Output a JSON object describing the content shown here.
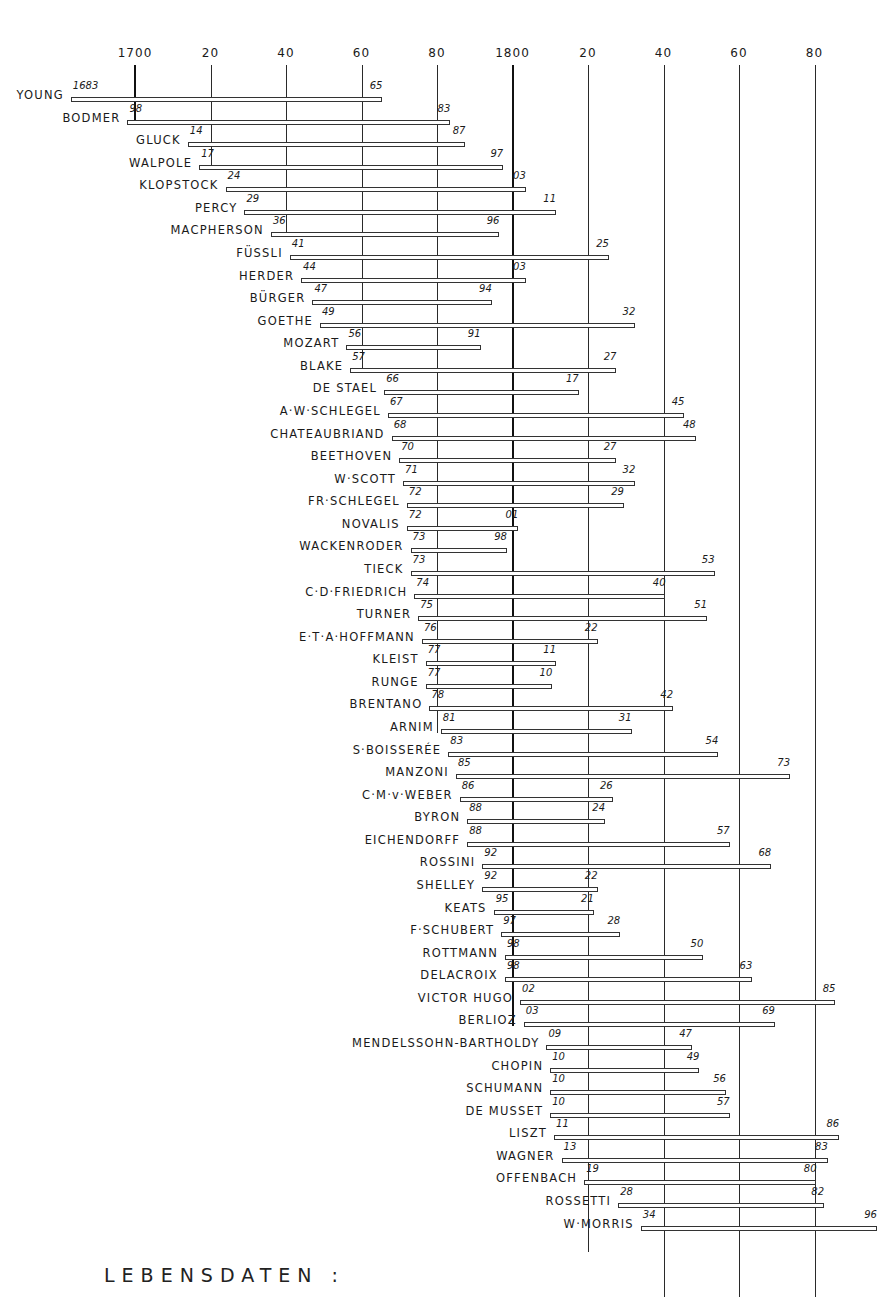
{
  "caption": "LEBENSDATEN :",
  "chart_data": {
    "type": "bar",
    "subtype": "timeline-gantt",
    "title": "LEBENSDATEN :",
    "xlabel": "",
    "ylabel": "",
    "xlim": [
      1680,
      1900
    ],
    "ticks": [
      {
        "year": 1700,
        "label": "1700"
      },
      {
        "year": 1720,
        "label": "20"
      },
      {
        "year": 1740,
        "label": "40"
      },
      {
        "year": 1760,
        "label": "60"
      },
      {
        "year": 1780,
        "label": "80"
      },
      {
        "year": 1800,
        "label": "1800"
      },
      {
        "year": 1820,
        "label": "20"
      },
      {
        "year": 1840,
        "label": "40"
      },
      {
        "year": 1860,
        "label": "60"
      },
      {
        "year": 1880,
        "label": "80"
      }
    ],
    "gridlines": [
      {
        "year": 1700,
        "end_row": 1,
        "major": true
      },
      {
        "year": 1720,
        "end_row": 3,
        "major": false
      },
      {
        "year": 1740,
        "end_row": 6,
        "major": false
      },
      {
        "year": 1760,
        "end_row": 12,
        "major": false
      },
      {
        "year": 1780,
        "end_row": 28,
        "major": false
      },
      {
        "year": 1800,
        "end_row": 41,
        "major": true
      },
      {
        "year": 1820,
        "end_row": 51,
        "major": false
      },
      {
        "year": 1840,
        "end_row": 53,
        "major": false
      },
      {
        "year": 1860,
        "end_row": 53,
        "major": false
      },
      {
        "year": 1880,
        "end_row": 53,
        "major": false
      }
    ],
    "series": [
      {
        "name": "YOUNG",
        "birth": 1683,
        "death": 1765,
        "birth_label": "1683",
        "death_label": "65"
      },
      {
        "name": "BODMER",
        "birth": 1698,
        "death": 1783,
        "birth_label": "98",
        "death_label": "83"
      },
      {
        "name": "GLUCK",
        "birth": 1714,
        "death": 1787,
        "birth_label": "14",
        "death_label": "87"
      },
      {
        "name": "WALPOLE",
        "birth": 1717,
        "death": 1797,
        "birth_label": "17",
        "death_label": "97"
      },
      {
        "name": "KLOPSTOCK",
        "birth": 1724,
        "death": 1803,
        "birth_label": "24",
        "death_label": "03"
      },
      {
        "name": "PERCY",
        "birth": 1729,
        "death": 1811,
        "birth_label": "29",
        "death_label": "11"
      },
      {
        "name": "MACPHERSON",
        "birth": 1736,
        "death": 1796,
        "birth_label": "36",
        "death_label": "96"
      },
      {
        "name": "FÜSSLI",
        "birth": 1741,
        "death": 1825,
        "birth_label": "41",
        "death_label": "25"
      },
      {
        "name": "HERDER",
        "birth": 1744,
        "death": 1803,
        "birth_label": "44",
        "death_label": "03"
      },
      {
        "name": "BÜRGER",
        "birth": 1747,
        "death": 1794,
        "birth_label": "47",
        "death_label": "94"
      },
      {
        "name": "GOETHE",
        "birth": 1749,
        "death": 1832,
        "birth_label": "49",
        "death_label": "32"
      },
      {
        "name": "MOZART",
        "birth": 1756,
        "death": 1791,
        "birth_label": "56",
        "death_label": "91"
      },
      {
        "name": "BLAKE",
        "birth": 1757,
        "death": 1827,
        "birth_label": "57",
        "death_label": "27"
      },
      {
        "name": "DE STAEL",
        "birth": 1766,
        "death": 1817,
        "birth_label": "66",
        "death_label": "17"
      },
      {
        "name": "A·W·SCHLEGEL",
        "birth": 1767,
        "death": 1845,
        "birth_label": "67",
        "death_label": "45"
      },
      {
        "name": "CHATEAUBRIAND",
        "birth": 1768,
        "death": 1848,
        "birth_label": "68",
        "death_label": "48"
      },
      {
        "name": "BEETHOVEN",
        "birth": 1770,
        "death": 1827,
        "birth_label": "70",
        "death_label": "27"
      },
      {
        "name": "W·SCOTT",
        "birth": 1771,
        "death": 1832,
        "birth_label": "71",
        "death_label": "32"
      },
      {
        "name": "FR·SCHLEGEL",
        "birth": 1772,
        "death": 1829,
        "birth_label": "72",
        "death_label": "29"
      },
      {
        "name": "NOVALIS",
        "birth": 1772,
        "death": 1801,
        "birth_label": "72",
        "death_label": "01"
      },
      {
        "name": "WACKENRODER",
        "birth": 1773,
        "death": 1798,
        "birth_label": "73",
        "death_label": "98"
      },
      {
        "name": "TIECK",
        "birth": 1773,
        "death": 1853,
        "birth_label": "73",
        "death_label": "53"
      },
      {
        "name": "C·D·FRIEDRICH",
        "birth": 1774,
        "death": 1840,
        "birth_label": "74",
        "death_label": "40"
      },
      {
        "name": "TURNER",
        "birth": 1775,
        "death": 1851,
        "birth_label": "75",
        "death_label": "51"
      },
      {
        "name": "E·T·A·HOFFMANN",
        "birth": 1776,
        "death": 1822,
        "birth_label": "76",
        "death_label": "22"
      },
      {
        "name": "KLEIST",
        "birth": 1777,
        "death": 1811,
        "birth_label": "77",
        "death_label": "11"
      },
      {
        "name": "RUNGE",
        "birth": 1777,
        "death": 1810,
        "birth_label": "77",
        "death_label": "10"
      },
      {
        "name": "BRENTANO",
        "birth": 1778,
        "death": 1842,
        "birth_label": "78",
        "death_label": "42"
      },
      {
        "name": "ARNIM",
        "birth": 1781,
        "death": 1831,
        "birth_label": "81",
        "death_label": "31"
      },
      {
        "name": "S·BOISSERÉE",
        "birth": 1783,
        "death": 1854,
        "birth_label": "83",
        "death_label": "54"
      },
      {
        "name": "MANZONI",
        "birth": 1785,
        "death": 1873,
        "birth_label": "85",
        "death_label": "73"
      },
      {
        "name": "C·M·v·WEBER",
        "birth": 1786,
        "death": 1826,
        "birth_label": "86",
        "death_label": "26"
      },
      {
        "name": "BYRON",
        "birth": 1788,
        "death": 1824,
        "birth_label": "88",
        "death_label": "24"
      },
      {
        "name": "EICHENDORFF",
        "birth": 1788,
        "death": 1857,
        "birth_label": "88",
        "death_label": "57"
      },
      {
        "name": "ROSSINI",
        "birth": 1792,
        "death": 1868,
        "birth_label": "92",
        "death_label": "68"
      },
      {
        "name": "SHELLEY",
        "birth": 1792,
        "death": 1822,
        "birth_label": "92",
        "death_label": "22"
      },
      {
        "name": "KEATS",
        "birth": 1795,
        "death": 1821,
        "birth_label": "95",
        "death_label": "21"
      },
      {
        "name": "F·SCHUBERT",
        "birth": 1797,
        "death": 1828,
        "birth_label": "97",
        "death_label": "28"
      },
      {
        "name": "ROTTMANN",
        "birth": 1798,
        "death": 1850,
        "birth_label": "98",
        "death_label": "50"
      },
      {
        "name": "DELACROIX",
        "birth": 1798,
        "death": 1863,
        "birth_label": "98",
        "death_label": "63"
      },
      {
        "name": "VICTOR HUGO",
        "birth": 1802,
        "death": 1885,
        "birth_label": "02",
        "death_label": "85"
      },
      {
        "name": "BERLIOZ",
        "birth": 1803,
        "death": 1869,
        "birth_label": "03",
        "death_label": "69"
      },
      {
        "name": "MENDELSSOHN-BARTHOLDY",
        "birth": 1809,
        "death": 1847,
        "birth_label": "09",
        "death_label": "47"
      },
      {
        "name": "CHOPIN",
        "birth": 1810,
        "death": 1849,
        "birth_label": "10",
        "death_label": "49"
      },
      {
        "name": "SCHUMANN",
        "birth": 1810,
        "death": 1856,
        "birth_label": "10",
        "death_label": "56"
      },
      {
        "name": "DE MUSSET",
        "birth": 1810,
        "death": 1857,
        "birth_label": "10",
        "death_label": "57"
      },
      {
        "name": "LISZT",
        "birth": 1811,
        "death": 1886,
        "birth_label": "11",
        "death_label": "86"
      },
      {
        "name": "WAGNER",
        "birth": 1813,
        "death": 1883,
        "birth_label": "13",
        "death_label": "83"
      },
      {
        "name": "OFFENBACH",
        "birth": 1819,
        "death": 1880,
        "birth_label": "19",
        "death_label": "80"
      },
      {
        "name": "ROSSETTI",
        "birth": 1828,
        "death": 1882,
        "birth_label": "28",
        "death_label": "82"
      },
      {
        "name": "W·MORRIS",
        "birth": 1834,
        "death": 1896,
        "birth_label": "34",
        "death_label": "96"
      }
    ],
    "grid": true,
    "legend": null
  }
}
